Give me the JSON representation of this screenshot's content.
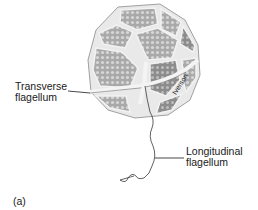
{
  "figure": {
    "panel_label": "(a)",
    "artist_credit": "Iverson",
    "labels": {
      "transverse": {
        "line1": "Transverse",
        "line2": "flagellum"
      },
      "longitudinal": {
        "line1": "Longitudinal",
        "line2": "flagellum"
      }
    },
    "colors": {
      "background": "#ffffff",
      "plate_fill": "#b9b9b9",
      "plate_dark": "#8f8f8f",
      "suture": "#ececec",
      "outline": "#7a7a7a",
      "text": "#1a1a1a"
    }
  }
}
